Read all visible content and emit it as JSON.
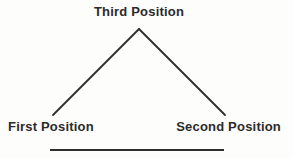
{
  "diagram": {
    "labels": {
      "top": "Third Position",
      "bottom_left": "First Position",
      "bottom_right": "Second Position"
    },
    "colors": {
      "line": "#2e2e2e",
      "text": "#2b2b2b",
      "background": "#fdfdfc"
    }
  }
}
